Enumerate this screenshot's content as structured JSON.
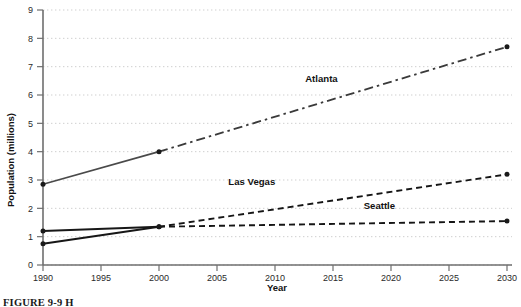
{
  "figure": {
    "caption_prefix": "FIGURE 9-9",
    "caption_rest": "H"
  },
  "chart_data": {
    "type": "line",
    "title": "",
    "xlabel": "Year",
    "ylabel": "Population (millions)",
    "xlim": [
      1990,
      2030
    ],
    "ylim": [
      0,
      9
    ],
    "grid": true,
    "legend": "inline-labels",
    "x": [
      1990,
      2000,
      2030
    ],
    "xticks": [
      1990,
      1995,
      2000,
      2005,
      2010,
      2015,
      2020,
      2025,
      2030
    ],
    "xtick_labels": [
      "1990",
      "1995",
      "2000",
      "2005",
      "2010",
      "2015",
      "2020",
      "2025",
      "2030"
    ],
    "yticks": [
      0,
      1,
      2,
      3,
      4,
      5,
      6,
      7,
      8,
      9
    ],
    "ytick_labels": [
      "0",
      "1",
      "2",
      "3",
      "4",
      "5",
      "6",
      "7",
      "8",
      "9"
    ],
    "series": [
      {
        "name": "Atlanta",
        "label": "Atlanta",
        "values": [
          2.85,
          4.0,
          7.7
        ],
        "historical_style": "solid",
        "projected_style": "dash-dot",
        "color": "#3a3a3a",
        "label_x": 2014,
        "label_y": 6.45
      },
      {
        "name": "Las Vegas",
        "label": "Las Vegas",
        "values": [
          0.75,
          1.35,
          3.2
        ],
        "historical_style": "solid",
        "projected_style": "dashed",
        "color": "#151515",
        "label_x": 2008,
        "label_y": 2.82
      },
      {
        "name": "Seattle",
        "label": "Seattle",
        "values": [
          1.2,
          1.35,
          1.55
        ],
        "historical_style": "solid",
        "projected_style": "dashed",
        "color": "#151515",
        "label_x": 2019,
        "label_y": 1.97
      }
    ]
  }
}
